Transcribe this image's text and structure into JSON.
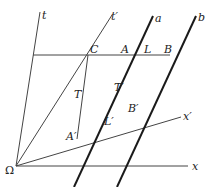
{
  "diagram": {
    "type": "spacetime (Minkowski) diagram",
    "origin": {
      "label": "Ω",
      "x": 16,
      "y": 166
    },
    "axes": [
      {
        "id": "t",
        "label": "t",
        "from": [
          16,
          166
        ],
        "to": [
          40,
          12
        ]
      },
      {
        "id": "t_prime",
        "label": "t′",
        "from": [
          16,
          166
        ],
        "to": [
          112,
          15
        ]
      },
      {
        "id": "x",
        "label": "x",
        "from": [
          16,
          166
        ],
        "to": [
          188,
          166
        ]
      },
      {
        "id": "x_prime",
        "label": "x′",
        "from": [
          16,
          166
        ],
        "to": [
          181,
          117
        ]
      }
    ],
    "worldlines": [
      {
        "id": "a",
        "label": "a",
        "from": [
          74,
          187
        ],
        "to": [
          153,
          16
        ],
        "weight": "heavy"
      },
      {
        "id": "b",
        "label": "b",
        "from": [
          117,
          187
        ],
        "to": [
          196,
          16
        ],
        "weight": "heavy"
      }
    ],
    "segments": [
      {
        "id": "simultaneity_line",
        "from": [
          33,
          55
        ],
        "to": [
          170,
          55
        ]
      },
      {
        "id": "T_segment",
        "from": [
          88,
          55
        ],
        "to": [
          77,
          139
        ]
      },
      {
        "id": "C_to_origin",
        "from": [
          16,
          166
        ],
        "to": [
          88,
          55
        ]
      }
    ],
    "points": [
      {
        "label": "C",
        "x": 88,
        "y": 55
      },
      {
        "label": "A",
        "x": 124,
        "y": 55
      },
      {
        "label": "B",
        "x": 170,
        "y": 55
      },
      {
        "label": "A′",
        "x": 77,
        "y": 139
      },
      {
        "label": "B′",
        "x": 137,
        "y": 114
      }
    ],
    "labels": {
      "t": "t",
      "t_prime": "t′",
      "a": "a",
      "b": "b",
      "C": "C",
      "A": "A",
      "L": "L",
      "B": "B",
      "T": "T",
      "T_prime": "T′",
      "x_prime": "x′",
      "B_prime": "B′",
      "L_prime": "L′",
      "A_prime": "A′",
      "omega": "Ω",
      "x": "x"
    },
    "colors": {
      "line": "#333333",
      "heavy_line": "#1a1a1a",
      "background": "#ffffff"
    }
  }
}
